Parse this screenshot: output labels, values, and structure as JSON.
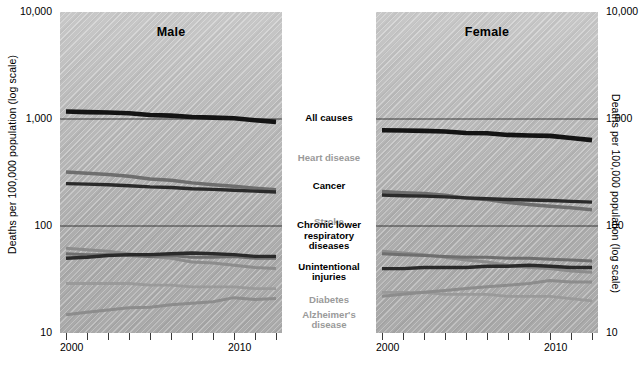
{
  "axis": {
    "y_title_left": "Deaths per 100,000 population (log scale)",
    "y_title_right": "Deaths per 100,000 population (log scale)",
    "y_ticks": [
      "10,000",
      "1,000",
      "100",
      "10"
    ],
    "x_label_start": "2000",
    "x_label_end": "2010"
  },
  "panels": {
    "male": {
      "title": "Male"
    },
    "female": {
      "title": "Female"
    }
  },
  "causes": [
    {
      "label": "All causes",
      "style": "bold"
    },
    {
      "label": "Heart disease",
      "style": "gray"
    },
    {
      "label": "Cancer",
      "style": "bold"
    },
    {
      "label": "Stroke",
      "style": "gray"
    },
    {
      "label": "Chronic lower respiratory diseases",
      "style": "bold"
    },
    {
      "label": "Unintentional injuries",
      "style": "bold"
    },
    {
      "label": "Diabetes",
      "style": "gray"
    },
    {
      "label": "Alzheimer's disease",
      "style": "gray"
    }
  ],
  "footnote": "",
  "chart_data": {
    "type": "line",
    "xlabel": "",
    "ylabel": "Deaths per 100,000 population (log scale)",
    "scale": "log10",
    "ylim": [
      10,
      10000
    ],
    "ytick_values": [
      10,
      100,
      1000,
      10000
    ],
    "ytick_labels": [
      "10",
      "100",
      "1,000",
      "10,000"
    ],
    "gridlines": [
      1000,
      100
    ],
    "grid": true,
    "legend": "center-column",
    "x": [
      2000,
      2001,
      2002,
      2003,
      2004,
      2005,
      2006,
      2007,
      2008,
      2009,
      2010
    ],
    "xtick_labels": [
      "2000",
      "",
      "",
      "",
      "",
      "",
      "",
      "",
      "",
      "",
      "2010"
    ],
    "panels": [
      {
        "name": "Male",
        "series": [
          {
            "name": "All causes",
            "color": "#141414",
            "width": 4.6,
            "values": [
              1175,
              1160,
              1150,
              1130,
              1090,
              1075,
              1045,
              1030,
              1015,
              975,
              940
            ]
          },
          {
            "name": "Heart disease",
            "color": "#6e6e6e",
            "width": 3.4,
            "values": [
              320,
              311,
              303,
              292,
              275,
              268,
              253,
              243,
              235,
              226,
              218
            ]
          },
          {
            "name": "Cancer",
            "color": "#2a2a2a",
            "width": 3.4,
            "values": [
              249,
              246,
              243,
              238,
              232,
              229,
              223,
              220,
              216,
              212,
              208
            ]
          },
          {
            "name": "Stroke",
            "color": "#8c8c8c",
            "width": 3.0,
            "values": [
              62,
              60,
              58,
              55,
              52,
              50,
              46,
              45,
              43,
              41,
              40
            ]
          },
          {
            "name": "Chronic lower respiratory diseases",
            "color": "#6e6e6e",
            "width": 3.0,
            "values": [
              55,
              54,
              54,
              53,
              52,
              53,
              51,
              51,
              52,
              50,
              50
            ]
          },
          {
            "name": "Unintentional injuries",
            "color": "#2a2a2a",
            "width": 3.4,
            "values": [
              50,
              51,
              53,
              54,
              54,
              55,
              56,
              55,
              54,
              52,
              52
            ]
          },
          {
            "name": "Diabetes",
            "color": "#9a9a9a",
            "width": 2.8,
            "values": [
              29,
              29,
              29,
              29,
              28,
              28,
              27,
              27,
              27,
              26,
              26
            ]
          },
          {
            "name": "Alzheimer's disease",
            "color": "#8c8c8c",
            "width": 3.0,
            "values": [
              14.8,
              15.6,
              16.4,
              17.2,
              17.4,
              18.4,
              19.0,
              19.6,
              21.4,
              20.6,
              21.0
            ]
          }
        ]
      },
      {
        "name": "Female",
        "series": [
          {
            "name": "All causes",
            "color": "#141414",
            "width": 4.6,
            "values": [
              785,
              780,
              775,
              765,
              740,
              735,
              710,
              700,
              695,
              665,
              635
            ]
          },
          {
            "name": "Heart disease",
            "color": "#6e6e6e",
            "width": 3.4,
            "values": [
              210,
              205,
              201,
              194,
              182,
              177,
              166,
              159,
              153,
              148,
              142
            ]
          },
          {
            "name": "Cancer",
            "color": "#2a2a2a",
            "width": 3.4,
            "values": [
              195,
              192,
              190,
              187,
              183,
              180,
              177,
              175,
              173,
              170,
              167
            ]
          },
          {
            "name": "Stroke",
            "color": "#8c8c8c",
            "width": 3.0,
            "values": [
              58,
              56,
              54,
              51,
              48,
              46,
              43,
              41,
              40,
              38,
              37
            ]
          },
          {
            "name": "Chronic lower respiratory diseases",
            "color": "#6e6e6e",
            "width": 3.0,
            "values": [
              55,
              54,
              53,
              52,
              51,
              51,
              50,
              50,
              49,
              48,
              47
            ]
          },
          {
            "name": "Unintentional injuries",
            "color": "#2a2a2a",
            "width": 3.4,
            "values": [
              40,
              40,
              41,
              41,
              41,
              42,
              42,
              43,
              42,
              41,
              41
            ]
          },
          {
            "name": "Diabetes",
            "color": "#9a9a9a",
            "width": 2.8,
            "values": [
              24,
              24,
              24,
              23,
              23,
              23,
              22,
              22,
              22,
              21,
              20
            ]
          },
          {
            "name": "Alzheimer's disease",
            "color": "#8c8c8c",
            "width": 3.0,
            "values": [
              22,
              23,
              24,
              25,
              26,
              27,
              28,
              29,
              31,
              30,
              30
            ]
          }
        ]
      }
    ]
  }
}
